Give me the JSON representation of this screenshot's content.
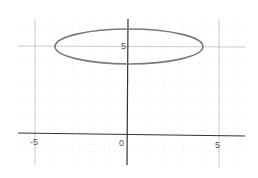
{
  "chart_data": {
    "type": "line",
    "title": "",
    "xlabel": "",
    "ylabel": "",
    "xlim": [
      -6,
      6.5
    ],
    "ylim": [
      -1.8,
      6.5
    ],
    "grid": true,
    "x_tick_labels": [
      "-5",
      "0",
      "5"
    ],
    "y_tick_labels": [
      "5"
    ],
    "series": [
      {
        "name": "ellipse",
        "equation": "x^2/16 + (y-5)^2 = 1",
        "center": [
          0,
          5
        ],
        "semi_axis_x": 4,
        "semi_axis_y": 1,
        "color": "#7a7a7a"
      }
    ]
  },
  "labels": {
    "x_neg5": "-5",
    "x_0": "0",
    "x_5": "5",
    "y_5": "5"
  },
  "colors": {
    "axis": "#333333",
    "major_grid": "#bdbdbd",
    "minor_grid": "#ececec",
    "curve": "#7a7a7a"
  }
}
